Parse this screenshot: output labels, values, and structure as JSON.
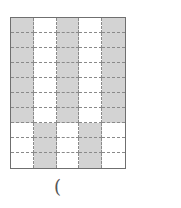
{
  "figure": {
    "columns": 5,
    "rows": 10,
    "fill_color": "#d3d3d3",
    "line_color": "#8a8a8a",
    "shaded_pattern": [
      [
        1,
        0,
        1,
        0,
        1
      ],
      [
        1,
        0,
        1,
        0,
        1
      ],
      [
        1,
        0,
        1,
        0,
        1
      ],
      [
        1,
        0,
        1,
        0,
        1
      ],
      [
        1,
        0,
        1,
        0,
        1
      ],
      [
        1,
        0,
        1,
        0,
        1
      ],
      [
        1,
        0,
        1,
        0,
        1
      ],
      [
        0,
        1,
        0,
        1,
        0
      ],
      [
        0,
        1,
        0,
        1,
        0
      ],
      [
        0,
        1,
        0,
        1,
        0
      ]
    ]
  },
  "caption": {
    "label": "("
  }
}
